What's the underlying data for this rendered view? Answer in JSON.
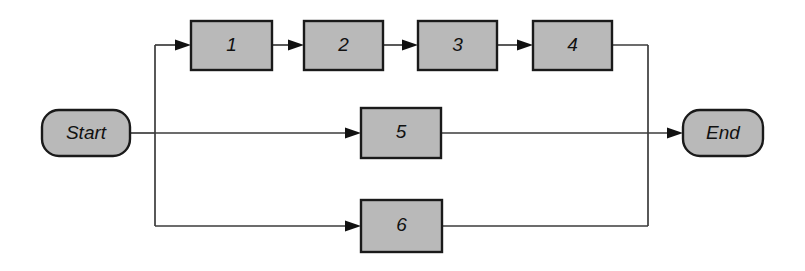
{
  "diagram": {
    "type": "activity-flow-network",
    "background_color": "#ffffff",
    "shape_fill_color": "#b9b9b9",
    "shape_stroke_color": "#1a1a1a",
    "line_color": "#3b3b3b",
    "start_node": {
      "label": "Start",
      "shape": "rounded-rectangle",
      "x": 42,
      "y": 110,
      "width": 88,
      "height": 46
    },
    "end_node": {
      "label": "End",
      "shape": "rounded-rectangle",
      "x": 683,
      "y": 110,
      "width": 80,
      "height": 46
    },
    "tasks": [
      {
        "label": "1",
        "x": 191,
        "y": 21,
        "width": 81,
        "height": 49
      },
      {
        "label": "2",
        "x": 304,
        "y": 21,
        "width": 79,
        "height": 49
      },
      {
        "label": "3",
        "x": 418,
        "y": 21,
        "width": 79,
        "height": 49
      },
      {
        "label": "4",
        "x": 533,
        "y": 21,
        "width": 79,
        "height": 49
      },
      {
        "label": "5",
        "x": 361,
        "y": 108,
        "width": 80,
        "height": 50
      },
      {
        "label": "6",
        "x": 361,
        "y": 200,
        "width": 81,
        "height": 52
      }
    ],
    "paths": [
      {
        "name": "branch-top",
        "sequence": [
          "Start",
          "1",
          "2",
          "3",
          "4",
          "End"
        ]
      },
      {
        "name": "branch-middle",
        "sequence": [
          "Start",
          "5",
          "End"
        ]
      },
      {
        "name": "branch-bottom",
        "sequence": [
          "Start",
          "6",
          "End"
        ]
      }
    ],
    "geometry": {
      "left_split_x": 155,
      "right_merge_x": 648,
      "top_row_y": 45,
      "middle_row_y": 133,
      "bottom_row_y": 226
    }
  }
}
